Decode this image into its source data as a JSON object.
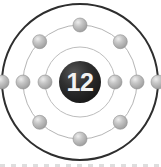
{
  "diagram": {
    "kind": "bohr-model-atom",
    "nucleus": {
      "label": "12",
      "fill_color": "#2b2b2b",
      "text_color": "#f2f2f2",
      "radius": 21
    },
    "center": {
      "x": 80,
      "y": 82
    },
    "shells": [
      {
        "name": "inner-shell",
        "index": 1,
        "radius": 35,
        "stroke_color": "#bdbdbd",
        "stroke_width": 1,
        "electron_count": 2,
        "electron_angles": [
          180,
          0
        ]
      },
      {
        "name": "middle-shell",
        "index": 2,
        "radius": 57,
        "stroke_color": "#b5b5b5",
        "stroke_width": 1,
        "electron_count": 8,
        "electron_angles": [
          0,
          45,
          90,
          135,
          180,
          225,
          270,
          315
        ]
      },
      {
        "name": "outer-shell",
        "index": 3,
        "radius": 78,
        "stroke_color": "#2e2e2e",
        "stroke_width": 2,
        "electron_count": 2,
        "electron_angles": [
          180,
          0
        ]
      }
    ],
    "electron": {
      "radius": 7,
      "fill_color": "#b0b0b0",
      "highlight_color": "#e2e2e2",
      "edge_color": "#8f8f8f"
    },
    "background_color": "#ffffff",
    "electron_configuration": "2-8-2",
    "total_electrons": 12,
    "bottom_rule_color": "#d8d8d8"
  }
}
